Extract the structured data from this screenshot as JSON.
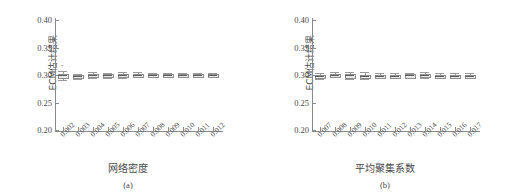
{
  "figure": {
    "background": "#ffffff",
    "box_fill": "#e8e8e8",
    "line_color": "#8d8d8d"
  },
  "chart_data": [
    {
      "type": "box",
      "panel": "(a)",
      "title": "",
      "xlabel": "网络密度",
      "ylabel": "ECM估计结果",
      "ylim": [
        0.2,
        0.4
      ],
      "yticks": [
        "0.20",
        "0.25",
        "0.30",
        "0.35",
        "0.40"
      ],
      "ytick_values": [
        0.2,
        0.25,
        0.3,
        0.35,
        0.4
      ],
      "grid": false,
      "legend": "none",
      "categories": [
        "0.002",
        "0.003",
        "0.004",
        "0.005",
        "0.006",
        "0.007",
        "0.008",
        "0.009",
        "0.010",
        "0.011",
        "0.012"
      ],
      "boxes": [
        {
          "x": "0.002",
          "whisker_low": 0.2915,
          "q1": 0.296,
          "median": 0.2995,
          "q3": 0.3025,
          "whisker_high": 0.308,
          "outliers": [
            0.314
          ]
        },
        {
          "x": "0.003",
          "whisker_low": 0.293,
          "q1": 0.2955,
          "median": 0.2975,
          "q3": 0.2992,
          "whisker_high": 0.302,
          "outliers": []
        },
        {
          "x": "0.004",
          "whisker_low": 0.2945,
          "q1": 0.2978,
          "median": 0.3,
          "q3": 0.3018,
          "whisker_high": 0.3055,
          "outliers": []
        },
        {
          "x": "0.005",
          "whisker_low": 0.295,
          "q1": 0.298,
          "median": 0.2998,
          "q3": 0.3012,
          "whisker_high": 0.3045,
          "outliers": []
        },
        {
          "x": "0.006",
          "whisker_low": 0.2948,
          "q1": 0.2982,
          "median": 0.3002,
          "q3": 0.302,
          "whisker_high": 0.3055,
          "outliers": []
        },
        {
          "x": "0.007",
          "whisker_low": 0.2955,
          "q1": 0.2985,
          "median": 0.3,
          "q3": 0.3015,
          "whisker_high": 0.3048,
          "outliers": []
        },
        {
          "x": "0.008",
          "whisker_low": 0.2958,
          "q1": 0.2984,
          "median": 0.3,
          "q3": 0.3014,
          "whisker_high": 0.3042,
          "outliers": []
        },
        {
          "x": "0.009",
          "whisker_low": 0.296,
          "q1": 0.2982,
          "median": 0.2996,
          "q3": 0.301,
          "whisker_high": 0.3038,
          "outliers": []
        },
        {
          "x": "0.010",
          "whisker_low": 0.2962,
          "q1": 0.2985,
          "median": 0.3,
          "q3": 0.3013,
          "whisker_high": 0.3038,
          "outliers": []
        },
        {
          "x": "0.011",
          "whisker_low": 0.2965,
          "q1": 0.2986,
          "median": 0.3,
          "q3": 0.3012,
          "whisker_high": 0.3035,
          "outliers": []
        },
        {
          "x": "0.012",
          "whisker_low": 0.2968,
          "q1": 0.2988,
          "median": 0.3001,
          "q3": 0.3013,
          "whisker_high": 0.3032,
          "outliers": []
        }
      ]
    },
    {
      "type": "box",
      "panel": "(b)",
      "title": "",
      "xlabel": "平均聚集系数",
      "ylabel": "ECM估计结果",
      "ylim": [
        0.2,
        0.4
      ],
      "yticks": [
        "0.20",
        "0.25",
        "0.30",
        "0.35",
        "0.40"
      ],
      "ytick_values": [
        0.2,
        0.25,
        0.3,
        0.35,
        0.4
      ],
      "grid": false,
      "legend": "none",
      "categories": [
        "0.007",
        "0.008",
        "0.009",
        "0.010",
        "0.011",
        "0.012",
        "0.013",
        "0.014",
        "0.015",
        "0.016",
        "0.017"
      ],
      "boxes": [
        {
          "x": "0.007",
          "whisker_low": 0.293,
          "q1": 0.2965,
          "median": 0.2988,
          "q3": 0.3008,
          "whisker_high": 0.304,
          "outliers": []
        },
        {
          "x": "0.008",
          "whisker_low": 0.296,
          "q1": 0.299,
          "median": 0.3008,
          "q3": 0.3022,
          "whisker_high": 0.305,
          "outliers": []
        },
        {
          "x": "0.009",
          "whisker_low": 0.293,
          "q1": 0.297,
          "median": 0.2992,
          "q3": 0.3012,
          "whisker_high": 0.306,
          "outliers": []
        },
        {
          "x": "0.010",
          "whisker_low": 0.2935,
          "q1": 0.2968,
          "median": 0.299,
          "q3": 0.3008,
          "whisker_high": 0.3048,
          "outliers": []
        },
        {
          "x": "0.011",
          "whisker_low": 0.2938,
          "q1": 0.2968,
          "median": 0.2988,
          "q3": 0.3006,
          "whisker_high": 0.3042,
          "outliers": []
        },
        {
          "x": "0.012",
          "whisker_low": 0.294,
          "q1": 0.297,
          "median": 0.299,
          "q3": 0.3008,
          "whisker_high": 0.304,
          "outliers": []
        },
        {
          "x": "0.013",
          "whisker_low": 0.2942,
          "q1": 0.2972,
          "median": 0.2992,
          "q3": 0.301,
          "whisker_high": 0.3045,
          "outliers": []
        },
        {
          "x": "0.014",
          "whisker_low": 0.2945,
          "q1": 0.2975,
          "median": 0.2995,
          "q3": 0.3012,
          "whisker_high": 0.3048,
          "outliers": []
        },
        {
          "x": "0.015",
          "whisker_low": 0.294,
          "q1": 0.297,
          "median": 0.299,
          "q3": 0.3008,
          "whisker_high": 0.304,
          "outliers": []
        },
        {
          "x": "0.016",
          "whisker_low": 0.2942,
          "q1": 0.2972,
          "median": 0.299,
          "q3": 0.3008,
          "whisker_high": 0.3042,
          "outliers": []
        },
        {
          "x": "0.017",
          "whisker_low": 0.2938,
          "q1": 0.297,
          "median": 0.299,
          "q3": 0.3008,
          "whisker_high": 0.3044,
          "outliers": []
        }
      ]
    }
  ]
}
